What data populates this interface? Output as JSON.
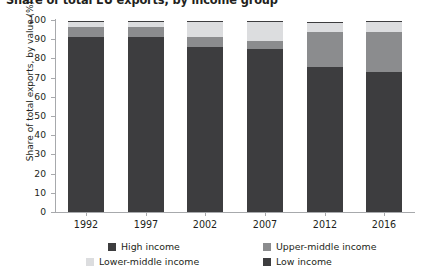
{
  "chart_data": {
    "type": "bar",
    "subtype": "stacked-bar",
    "title": "Share of total EU exports, by income group",
    "xlabel": "",
    "ylabel": "Share of total exports, by value (%)",
    "categories": [
      "1992",
      "1997",
      "2002",
      "2007",
      "2012",
      "2016"
    ],
    "ylim": [
      0,
      100
    ],
    "yticks": [
      "0",
      "10",
      "20",
      "30",
      "40",
      "50",
      "60",
      "70",
      "80",
      "90",
      "100"
    ],
    "grid": false,
    "legend_position": "bottom",
    "stack_order_bottom_to_top": [
      "High income",
      "Upper-middle income",
      "Lower-middle income",
      "Low income"
    ],
    "series": [
      {
        "name": "High income",
        "color": "#3d3d3f",
        "values": [
          91.0,
          91.0,
          86.0,
          85.0,
          75.5,
          73.0
        ]
      },
      {
        "name": "Upper-middle income",
        "color": "#8b8c8e",
        "values": [
          5.5,
          5.5,
          5.0,
          4.0,
          18.0,
          21.0
        ]
      },
      {
        "name": "Lower-middle income",
        "color": "#dcdddf",
        "values": [
          2.5,
          2.5,
          8.0,
          10.0,
          5.0,
          5.0
        ]
      },
      {
        "name": "Low income",
        "color": "#3d3d3f",
        "values": [
          0.6,
          0.6,
          0.5,
          0.5,
          0.5,
          0.5
        ]
      }
    ]
  },
  "legend": {
    "items": [
      {
        "label": "High income",
        "color": "#3d3d3f"
      },
      {
        "label": "Upper-middle income",
        "color": "#8b8c8e"
      },
      {
        "label": "Lower-middle income",
        "color": "#dcdddf"
      },
      {
        "label": "Low income",
        "color": "#3d3d3f"
      }
    ]
  },
  "colors": {
    "axis": "#a7a9ac",
    "text": "#231f20",
    "background": "#ffffff"
  }
}
